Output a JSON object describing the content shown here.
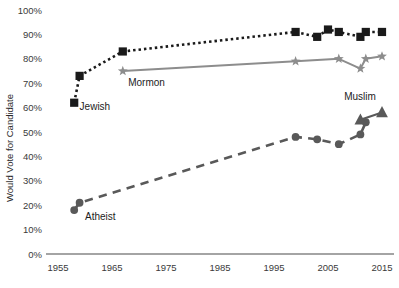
{
  "chart_data": {
    "type": "line",
    "title": "",
    "xlabel": "",
    "ylabel": "Would Vote for Candidate",
    "xlim": [
      1955,
      2015
    ],
    "ylim": [
      0,
      100
    ],
    "grid": false,
    "legend_position": "inline-labels",
    "y_ticks": [
      "0%",
      "10%",
      "20%",
      "30%",
      "40%",
      "50%",
      "60%",
      "70%",
      "80%",
      "90%",
      "100%"
    ],
    "y_tick_values": [
      0,
      10,
      20,
      30,
      40,
      50,
      60,
      70,
      80,
      90,
      100
    ],
    "x_ticks": [
      "1955",
      "1965",
      "1975",
      "1985",
      "1995",
      "2005",
      "2015"
    ],
    "x_tick_values": [
      1955,
      1965,
      1975,
      1985,
      1995,
      2005,
      2015
    ],
    "series": [
      {
        "name": "Jewish",
        "label": "Jewish",
        "color": "#1a1a1a",
        "marker": "square",
        "linestyle": "dotted",
        "x": [
          1958,
          1959,
          1967,
          1999,
          2003,
          2005,
          2007,
          2011,
          2012,
          2015
        ],
        "values": [
          62,
          73,
          83,
          91,
          89,
          92,
          91,
          89,
          91,
          91
        ]
      },
      {
        "name": "Mormon",
        "label": "Mormon",
        "color": "#8d8d8d",
        "marker": "star",
        "linestyle": "solid",
        "x": [
          1967,
          1999,
          2007,
          2011,
          2012,
          2015
        ],
        "values": [
          75,
          79,
          80,
          76,
          80,
          81
        ]
      },
      {
        "name": "Atheist",
        "label": "Atheist",
        "color": "#595959",
        "marker": "circle",
        "linestyle": "dashed",
        "x": [
          1958,
          1959,
          1999,
          2003,
          2007,
          2011,
          2012
        ],
        "values": [
          18,
          21,
          48,
          47,
          45,
          49,
          54
        ]
      },
      {
        "name": "Muslim",
        "label": "Muslim",
        "color": "#595959",
        "marker": "triangle",
        "linestyle": "solid",
        "x": [
          2011,
          2015
        ],
        "values": [
          55,
          58
        ]
      }
    ],
    "series_labels": [
      {
        "text": "Jewish",
        "x": 1959,
        "y": 59
      },
      {
        "text": "Mormon",
        "x": 1968,
        "y": 69
      },
      {
        "text": "Atheist",
        "x": 1960,
        "y": 14
      },
      {
        "text": "Muslim",
        "x": 2008,
        "y": 63
      }
    ]
  }
}
